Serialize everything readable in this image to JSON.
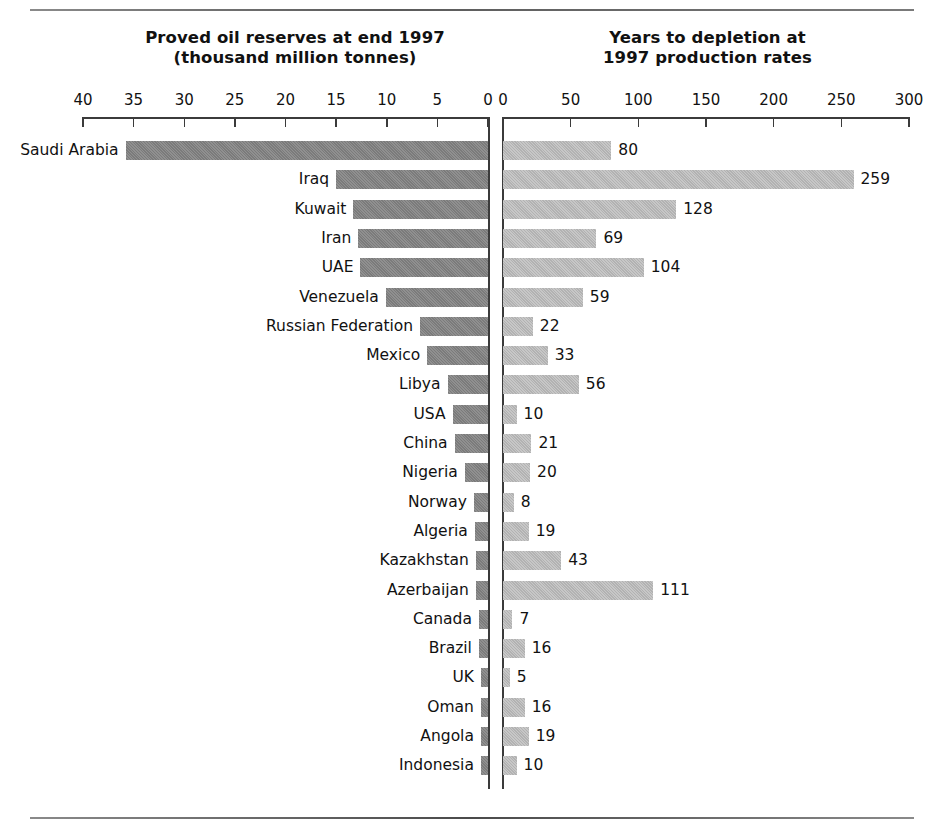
{
  "figure": {
    "left_title_line1": "Proved oil reserves at end 1997",
    "left_title_line2": "(thousand million tonnes)",
    "right_title_line1": "Years to depletion at",
    "right_title_line2": "1997 production rates"
  },
  "colors": {
    "bar_left": "#7b7b7b",
    "bar_right": "#b2b2b2",
    "axis": "#3b3b3b",
    "text": "#111111",
    "background": "#ffffff"
  },
  "chart_data": {
    "type": "bar",
    "orientation": "horizontal",
    "layout": "butterfly-diverging-pair",
    "grid": false,
    "legend": "none",
    "categories": [
      "Saudi Arabia",
      "Iraq",
      "Kuwait",
      "Iran",
      "UAE",
      "Venezuela",
      "Russian Federation",
      "Mexico",
      "Libya",
      "USA",
      "China",
      "Nigeria",
      "Norway",
      "Algeria",
      "Kazakhstan",
      "Azerbaijan",
      "Canada",
      "Brazil",
      "UK",
      "Oman",
      "Angola",
      "Indonesia"
    ],
    "panels": [
      {
        "name": "reserves",
        "side": "left",
        "title": "Proved oil reserves at end 1997 (thousand million tonnes)",
        "xlabel": "thousand million tonnes",
        "ylabel": "",
        "xlim": [
          40,
          0
        ],
        "reversed": true,
        "ticks": [
          40,
          35,
          30,
          25,
          20,
          15,
          10,
          5,
          0
        ],
        "value_labels_shown": false,
        "values": [
          35.8,
          15.0,
          13.3,
          12.8,
          12.6,
          10.1,
          6.7,
          6.0,
          4.0,
          3.5,
          3.3,
          2.3,
          1.4,
          1.3,
          1.2,
          1.2,
          0.9,
          0.9,
          0.7,
          0.7,
          0.7,
          0.7
        ]
      },
      {
        "name": "depletion",
        "side": "right",
        "title": "Years to depletion at 1997 production rates",
        "xlabel": "years",
        "ylabel": "",
        "xlim": [
          0,
          300
        ],
        "reversed": false,
        "ticks": [
          0,
          50,
          100,
          150,
          200,
          250,
          300
        ],
        "value_labels_shown": true,
        "values": [
          80,
          259,
          128,
          69,
          104,
          59,
          22,
          33,
          56,
          10,
          21,
          20,
          8,
          19,
          43,
          111,
          7,
          16,
          5,
          16,
          19,
          10
        ]
      }
    ]
  }
}
